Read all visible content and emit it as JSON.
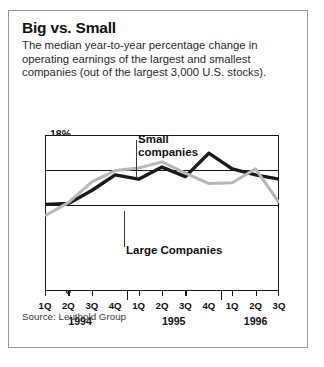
{
  "card": {
    "title": "Big vs. Small",
    "subtitle": "The median year-to-year percentage change in operating earnings of the largest and smallest companies (out of the largest 3,000 U.S. stocks).",
    "source": "Source: Leuthold Group"
  },
  "chart_data": {
    "type": "line",
    "title": "Big vs. Small",
    "subtitle": "The median year-to-year percentage change in operating earnings of the largest and smallest companies (out of the largest 3,000 U.S. stocks).",
    "xlabel": "",
    "ylabel": "",
    "ylim": [
      0,
      18
    ],
    "ytick_values": [
      0,
      10,
      14,
      18
    ],
    "ytick_labels": [
      "0",
      "10",
      "14",
      "18%"
    ],
    "gridlines": [
      10,
      14
    ],
    "grid": true,
    "legend": "inline-annotations",
    "x": [
      "1Q",
      "2Q",
      "3Q",
      "4Q",
      "1Q",
      "2Q",
      "3Q",
      "4Q",
      "1Q",
      "2Q",
      "3Q"
    ],
    "year_groups": [
      {
        "label": "1994",
        "start_index": 0,
        "end_index": 3
      },
      {
        "label": "1995",
        "start_index": 4,
        "end_index": 7
      },
      {
        "label": "1996",
        "start_index": 8,
        "end_index": 10
      }
    ],
    "series": [
      {
        "name": "Small companies",
        "color": "#b8b8b8",
        "values": [
          8.7,
          10.2,
          12.6,
          13.9,
          14.2,
          14.9,
          13.6,
          12.4,
          12.5,
          14.1,
          10.2
        ]
      },
      {
        "name": "Large Companies",
        "color": "#1a1a1a",
        "values": [
          10.0,
          10.1,
          11.6,
          13.4,
          12.9,
          14.3,
          13.2,
          15.9,
          14.1,
          13.4,
          12.9
        ]
      }
    ],
    "annotations": [
      {
        "text": "Small\ncompanies",
        "line1": "Small",
        "line2": "companies",
        "target_index": 4
      },
      {
        "text": "Large Companies",
        "line1": "Large Companies",
        "target_index": 3
      }
    ]
  },
  "axis": {
    "ytick_18": "18%",
    "ytick_14": "14",
    "ytick_10": "10",
    "ytick_0": "0",
    "quarters": [
      "1Q",
      "2Q",
      "3Q",
      "4Q",
      "1Q",
      "2Q",
      "3Q",
      "4Q",
      "1Q",
      "2Q",
      "3Q"
    ],
    "years": [
      "1994",
      "1995",
      "1996"
    ]
  },
  "callouts": {
    "small_line1": "Small",
    "small_line2": "companies",
    "large": "Large Companies"
  },
  "colors": {
    "small_series": "#b8b8b8",
    "large_series": "#1a1a1a",
    "border": "#9a9a9a",
    "axis": "#1a1a1a"
  }
}
